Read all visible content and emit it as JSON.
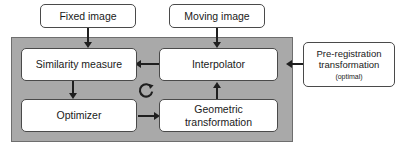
{
  "diagram": {
    "panel": {
      "name": "registration-loop-panel",
      "fill_color": "#a9a9a9",
      "border_color": "#6e6e6e"
    },
    "nodes": {
      "fixed_image": {
        "label": "Fixed image"
      },
      "moving_image": {
        "label": "Moving image"
      },
      "similarity_measure": {
        "label": "Similarity measure"
      },
      "interpolator": {
        "label": "Interpolator"
      },
      "optimizer": {
        "label": "Optimizer"
      },
      "geometric_transformation": {
        "label": "Geometric\ntransformation"
      },
      "pre_registration": {
        "label": "Pre-registration\ntransformation",
        "sublabel": "(optimal)"
      }
    },
    "icons": {
      "loop": "refresh-loop-icon"
    },
    "edges": [
      {
        "from": "fixed_image",
        "to": "similarity_measure",
        "direction": "down"
      },
      {
        "from": "moving_image",
        "to": "interpolator",
        "direction": "down"
      },
      {
        "from": "interpolator",
        "to": "similarity_measure",
        "direction": "left"
      },
      {
        "from": "similarity_measure",
        "to": "optimizer",
        "direction": "down"
      },
      {
        "from": "optimizer",
        "to": "geometric_transformation",
        "direction": "right"
      },
      {
        "from": "geometric_transformation",
        "to": "interpolator",
        "direction": "up"
      },
      {
        "from": "pre_registration",
        "to": "interpolator",
        "direction": "left"
      }
    ],
    "colors": {
      "node_fill": "#ffffff",
      "node_border": "#4a4a4a",
      "connector": "#1f1f1f",
      "background": "#ffffff"
    }
  }
}
